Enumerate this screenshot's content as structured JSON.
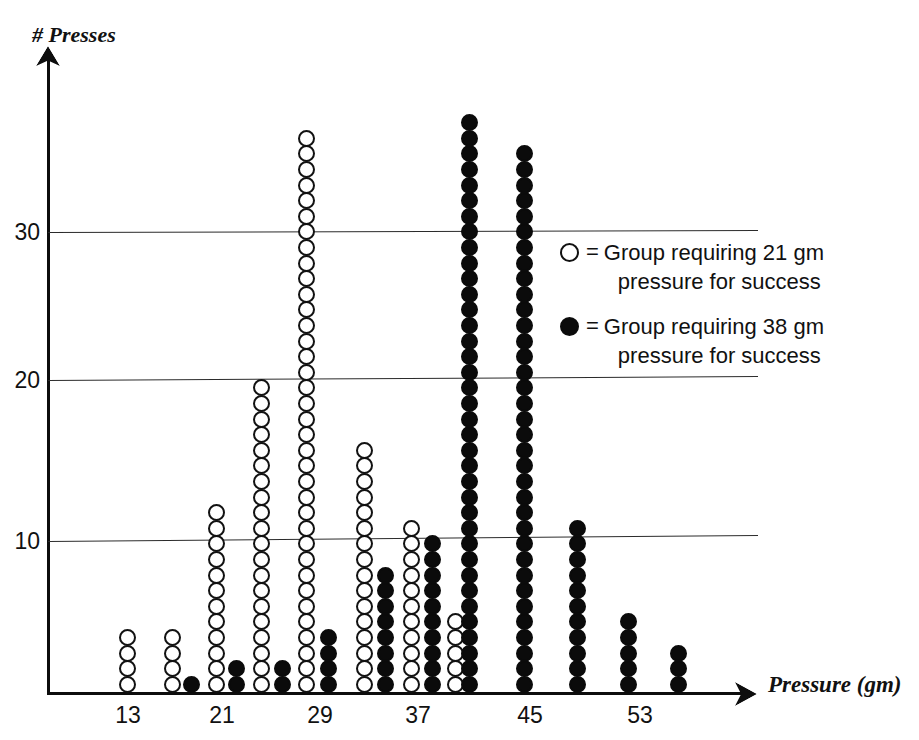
{
  "chart_data": {
    "type": "scatter",
    "plot_style": "dot-plot",
    "title": "",
    "xlabel": "Pressure (gm)",
    "ylabel": "# Presses",
    "xticks": [
      13,
      21,
      29,
      37,
      45,
      53
    ],
    "xtick_labels": [
      "13",
      "21",
      "29",
      "37",
      "45",
      "53"
    ],
    "yticks": [
      10,
      20,
      30
    ],
    "ytick_labels": [
      "10",
      "20",
      "30"
    ],
    "xlim": [
      9,
      61
    ],
    "ylim": [
      0,
      40
    ],
    "grid": "horizontal",
    "legend_position": "center-right",
    "series": [
      {
        "name": "Group requiring 21 gm pressure for success",
        "marker": "open-circle",
        "color": "#ffffff",
        "edge_color": "#121212",
        "x": [
          13,
          17,
          21,
          25,
          29,
          33,
          37,
          41
        ],
        "values": [
          4,
          4,
          12,
          20,
          36,
          16,
          11,
          5
        ]
      },
      {
        "name": "Group requiring 38 gm pressure for success",
        "marker": "filled-circle",
        "color": "#0b0b0b",
        "edge_color": "#0b0b0b",
        "x": [
          17,
          21,
          25,
          29,
          33,
          37,
          41,
          45,
          49,
          53,
          57
        ],
        "values": [
          1,
          2,
          2,
          4,
          8,
          10,
          37,
          35,
          11,
          5,
          3
        ]
      }
    ]
  },
  "axes": {
    "y_title": "# Presses",
    "x_title": "Pressure (gm)",
    "y_ticks": [
      {
        "label": "30",
        "value": 30
      },
      {
        "label": "20",
        "value": 20
      },
      {
        "label": "10",
        "value": 10
      }
    ],
    "x_ticks": [
      {
        "label": "13",
        "value": 13
      },
      {
        "label": "21",
        "value": 21
      },
      {
        "label": "29",
        "value": 29
      },
      {
        "label": "37",
        "value": 37
      },
      {
        "label": "45",
        "value": 45
      },
      {
        "label": "53",
        "value": 53
      }
    ]
  },
  "legend": {
    "entries": [
      {
        "marker": "open-circle",
        "equals": "=",
        "line1": "Group requiring 21 gm",
        "line2": "pressure for success"
      },
      {
        "marker": "filled-circle",
        "equals": "=",
        "line1": "Group requiring 38 gm",
        "line2": "pressure for success"
      }
    ]
  },
  "columns": [
    {
      "x_px": 127,
      "count": 4,
      "style": "open"
    },
    {
      "x_px": 172,
      "count": 4,
      "style": "open"
    },
    {
      "x_px": 191,
      "count": 1,
      "style": "filled"
    },
    {
      "x_px": 216,
      "count": 12,
      "style": "open"
    },
    {
      "x_px": 236,
      "count": 2,
      "style": "filled"
    },
    {
      "x_px": 261,
      "count": 20,
      "style": "open"
    },
    {
      "x_px": 282,
      "count": 2,
      "style": "filled"
    },
    {
      "x_px": 306,
      "count": 36,
      "style": "open"
    },
    {
      "x_px": 328,
      "count": 4,
      "style": "filled"
    },
    {
      "x_px": 364,
      "count": 16,
      "style": "open"
    },
    {
      "x_px": 385,
      "count": 8,
      "style": "filled"
    },
    {
      "x_px": 411,
      "count": 11,
      "style": "open"
    },
    {
      "x_px": 432,
      "count": 10,
      "style": "filled"
    },
    {
      "x_px": 455,
      "count": 5,
      "style": "open"
    },
    {
      "x_px": 469,
      "count": 37,
      "style": "filled"
    },
    {
      "x_px": 524,
      "count": 35,
      "style": "filled"
    },
    {
      "x_px": 577,
      "count": 11,
      "style": "filled"
    },
    {
      "x_px": 628,
      "count": 5,
      "style": "filled"
    },
    {
      "x_px": 678,
      "count": 3,
      "style": "filled"
    }
  ],
  "gridlines": [
    {
      "value": 30,
      "y_px": 232,
      "tilt_px": -2
    },
    {
      "value": 20,
      "y_px": 380,
      "tilt_px": -4
    },
    {
      "value": 10,
      "y_px": 541,
      "tilt_px": -6
    }
  ],
  "x_tick_positions": [
    {
      "label": "13",
      "x_px": 128
    },
    {
      "label": "21",
      "x_px": 222
    },
    {
      "label": "29",
      "x_px": 320
    },
    {
      "label": "37",
      "x_px": 418
    },
    {
      "label": "45",
      "x_px": 530
    },
    {
      "label": "53",
      "x_px": 640
    }
  ],
  "y_tick_positions": [
    {
      "label": "30",
      "y_px": 219
    },
    {
      "label": "20",
      "y_px": 367
    },
    {
      "label": "10",
      "y_px": 528
    }
  ]
}
